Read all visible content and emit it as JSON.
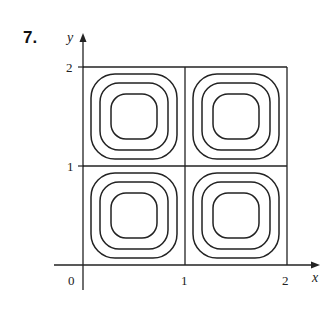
{
  "problem_number": "7.",
  "axes": {
    "x_label": "x",
    "y_label": "y",
    "x_ticks": [
      "0",
      "1",
      "2"
    ],
    "y_ticks": [
      "1",
      "2"
    ]
  },
  "figure": {
    "grid_lines": {
      "x": [
        1,
        2
      ],
      "y": [
        1,
        2
      ]
    },
    "cells": [
      {
        "name": "top-left",
        "x_range": [
          0,
          1
        ],
        "y_range": [
          1,
          2
        ],
        "contours": 3
      },
      {
        "name": "top-right",
        "x_range": [
          1,
          2
        ],
        "y_range": [
          1,
          2
        ],
        "contours": 3
      },
      {
        "name": "bottom-left",
        "x_range": [
          0,
          1
        ],
        "y_range": [
          0,
          1
        ],
        "contours": 3
      },
      {
        "name": "bottom-right",
        "x_range": [
          1,
          2
        ],
        "y_range": [
          0,
          1
        ],
        "contours": 3
      }
    ],
    "line_color": "#222222"
  }
}
